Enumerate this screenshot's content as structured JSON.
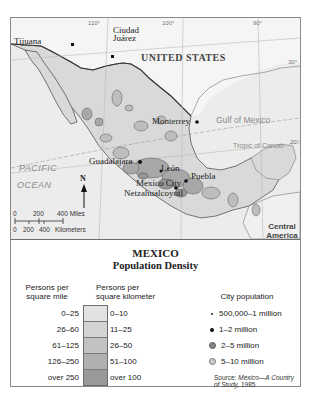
{
  "map": {
    "title": "MEXICO",
    "subtitle": "Population Density",
    "longitudes": [
      "110°",
      "100°",
      "90°"
    ],
    "latitudes": [
      "30°",
      "20°"
    ],
    "regions": {
      "country_north": "UNITED STATES",
      "country_south": "Central America",
      "ocean": "PACIFIC OCEAN",
      "ocean_line1": "PACIFIC",
      "ocean_line2": "OCEAN",
      "gulf": "Gulf of Mexico",
      "tropic": "Tropic of Cancer"
    },
    "cities": [
      {
        "name": "Tijuana"
      },
      {
        "name": "Ciudad Juárez",
        "line1": "Ciudad",
        "line2": "Juárez"
      },
      {
        "name": "Monterrey"
      },
      {
        "name": "Guadalajara"
      },
      {
        "name": "León"
      },
      {
        "name": "Mexico City"
      },
      {
        "name": "Puebla"
      },
      {
        "name": "Netzahualcoyotl"
      }
    ],
    "north_arrow": "N",
    "scale": {
      "miles": [
        "0",
        "200",
        "400 Miles"
      ],
      "kilometers": [
        "0",
        "200",
        "400",
        "Kilometers"
      ]
    },
    "colors": {
      "land": "#dcdcdc",
      "water": "#ececec",
      "us_land": "#f7f7f7",
      "border": "#444444"
    }
  },
  "legend": {
    "density_header_mile_l1": "Persons per",
    "density_header_mile_l2": "square mile",
    "density_header_km_l1": "Persons per",
    "density_header_km_l2": "square kilometer",
    "density_rows": [
      {
        "per_mile": "0–25",
        "per_km": "0–10",
        "color": "#e2e2e2"
      },
      {
        "per_mile": "26–60",
        "per_km": "11–25",
        "color": "#d4d4d4"
      },
      {
        "per_mile": "61–125",
        "per_km": "26–50",
        "color": "#c2c2c2"
      },
      {
        "per_mile": "126–250",
        "per_km": "51–100",
        "color": "#b0b0b0"
      },
      {
        "per_mile": "over 250",
        "per_km": "over 100",
        "color": "#999999"
      }
    ],
    "city_header": "City population",
    "city_rows": [
      {
        "label": "500,000–1 million",
        "symbol": "small-dot"
      },
      {
        "label": "1–2 million",
        "symbol": "dot"
      },
      {
        "label": "2–5 million",
        "symbol": "gray-circle"
      },
      {
        "label": "5–10 million",
        "symbol": "ring-circle"
      }
    ],
    "source_prefix": "Source: ",
    "source_title_l1": "Mexico—A Country",
    "source_title_l2": "of Study,",
    "source_year": " 1985"
  }
}
